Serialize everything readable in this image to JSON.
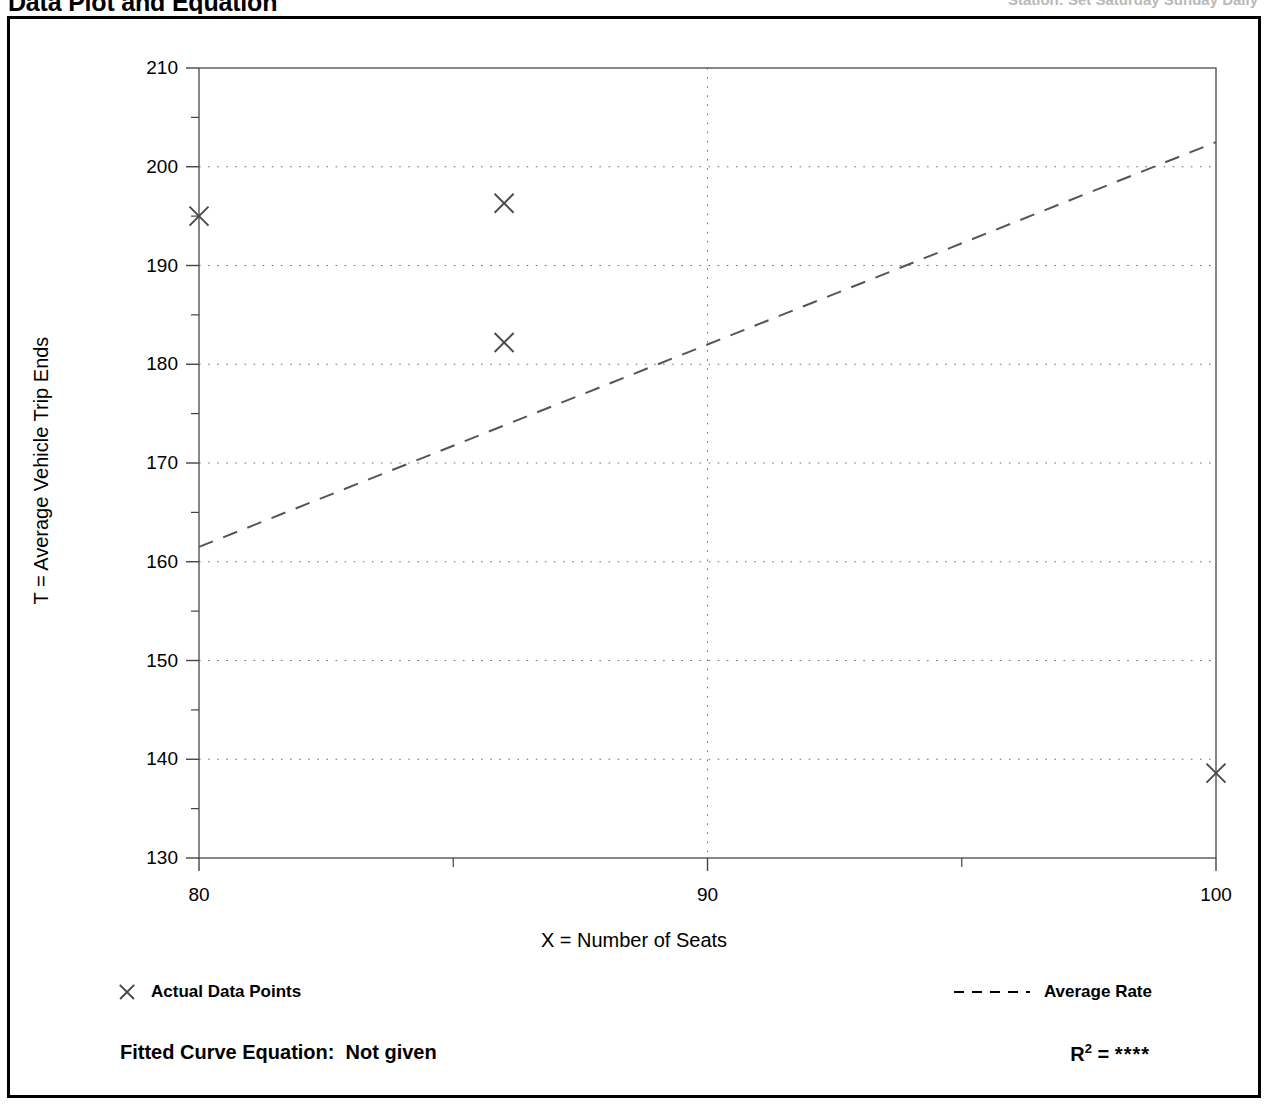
{
  "header": {
    "title": "Data Plot and Equation",
    "right_text": "Station:  Set Saturday  Sunday Daily"
  },
  "legend": {
    "points_label": "Actual Data Points",
    "points_marker": "x-marker-icon",
    "rate_label": "Average Rate",
    "rate_marker": "dashed-line-icon"
  },
  "equation": {
    "fitted_label": "Fitted Curve Equation:",
    "fitted_value": "Not given",
    "r_label": "R",
    "r_exponent": "2",
    "r_equals": "=",
    "r_value": "****"
  },
  "chart_data": {
    "type": "scatter",
    "title": "Data Plot and Equation",
    "xlabel": "X = Number of Seats",
    "ylabel": "T = Average Vehicle Trip Ends",
    "xlim": [
      80,
      100
    ],
    "ylim": [
      130,
      210
    ],
    "xticks": [
      80,
      90,
      100
    ],
    "xtick_labels": [
      "80",
      "90",
      "100"
    ],
    "xticks_minor": [
      85,
      95
    ],
    "yticks": [
      130,
      140,
      150,
      160,
      170,
      180,
      190,
      200,
      210
    ],
    "ytick_labels": [
      "130",
      "140",
      "150",
      "160",
      "170",
      "180",
      "190",
      "200",
      "210"
    ],
    "yticks_minor": [
      135,
      145,
      155,
      165,
      175,
      185,
      195,
      205
    ],
    "grid": "dotted-major-both",
    "legend_position": "below-plot",
    "series": [
      {
        "name": "Actual Data Points",
        "type": "scatter",
        "marker": "x",
        "color": "#4a4a4a",
        "points": [
          {
            "x": 80,
            "y": 195.0
          },
          {
            "x": 86,
            "y": 196.3
          },
          {
            "x": 86,
            "y": 182.2
          },
          {
            "x": 100,
            "y": 138.6
          }
        ]
      },
      {
        "name": "Average Rate",
        "type": "line",
        "style": "dashed",
        "color": "#555555",
        "points": [
          {
            "x": 80,
            "y": 161.5
          },
          {
            "x": 100,
            "y": 202.5
          }
        ]
      }
    ]
  }
}
